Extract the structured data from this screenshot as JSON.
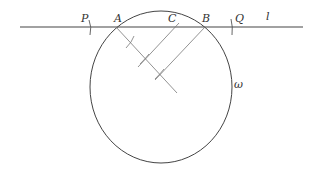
{
  "diagram": {
    "type": "geometric-construction",
    "colors": {
      "stroke": "#444444",
      "construction": "#777777",
      "text": "#333333"
    },
    "line": {
      "label": "l",
      "x1": 20,
      "y1": 27,
      "x2": 303,
      "y2": 27
    },
    "circle": {
      "label": "ω",
      "cx": 161,
      "cy": 87,
      "rx": 71,
      "ry": 76
    },
    "points": [
      {
        "label": "P",
        "x": 92,
        "y": 27
      },
      {
        "label": "A",
        "x": 116,
        "y": 27
      },
      {
        "label": "C",
        "x": 177,
        "y": 27
      },
      {
        "label": "B",
        "x": 205,
        "y": 27
      },
      {
        "label": "Q",
        "x": 232,
        "y": 27
      }
    ],
    "labels": {
      "P": "P",
      "A": "A",
      "C": "C",
      "B": "B",
      "Q": "Q",
      "l": "l",
      "omega": "ω"
    }
  }
}
